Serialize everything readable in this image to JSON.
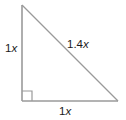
{
  "figure": {
    "type": "right-triangle-diagram",
    "background_color": "#ffffff",
    "stroke_color": "#9a9a9a",
    "text_color": "#1a1a1a",
    "vertices": {
      "top": [
        22,
        5
      ],
      "bottom_left": [
        22,
        101
      ],
      "bottom_right": [
        118,
        101
      ]
    },
    "right_angle_marker": {
      "at": "bottom_left",
      "size": 10
    },
    "labels": {
      "vertical_leg": {
        "number": "1",
        "variable": "x"
      },
      "hypotenuse": {
        "number": "1.4",
        "variable": "x"
      },
      "horizontal_leg": {
        "number": "1",
        "variable": "x"
      }
    }
  }
}
